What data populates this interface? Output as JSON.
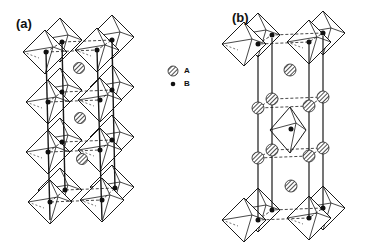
{
  "figure": {
    "panels": [
      {
        "id": "a",
        "label": "(a)",
        "structure": "corner-sharing octahedra perovskite column",
        "a_sites": 3,
        "layers": 4
      },
      {
        "id": "b",
        "label": "(b)",
        "structure": "octahedra column with A-site rings",
        "a_sites_center": 2,
        "a_sites_ring": 8
      }
    ],
    "legend": {
      "items": [
        {
          "symbol": "hatched-circle",
          "label": "A"
        },
        {
          "symbol": "filled-dot",
          "label": "B"
        }
      ]
    },
    "colors": {
      "line": "#1a1a1a",
      "background": "#ffffff"
    }
  }
}
